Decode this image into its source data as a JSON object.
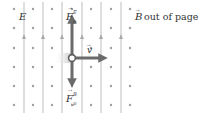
{
  "diagram": {
    "colors": {
      "field_line": "#bdbdbd",
      "dot": "#9e9e9e",
      "vector": "#6b6b6b",
      "text": "#333333",
      "particle_glow": "#e0e0e0"
    },
    "labels": {
      "E_field": "E",
      "B_field_symbol": "B",
      "B_field_text": "out of page",
      "velocity": "v",
      "force_electric_main": "F",
      "force_electric_sub": "p",
      "force_electric_sup": "E",
      "force_magnetic_main": "F",
      "force_magnetic_sub": "p",
      "force_magnetic_sup": "B"
    },
    "grid": {
      "dot_columns_x": [
        14,
        33,
        52,
        72,
        91,
        111,
        130
      ],
      "dot_rows_y": [
        9,
        28,
        48,
        67,
        86,
        105
      ],
      "field_lines_x": [
        24,
        43,
        62,
        82,
        101,
        121
      ],
      "field_direction": "up"
    },
    "particle": {
      "x": 72,
      "y": 58
    },
    "vectors": [
      {
        "name": "F_E",
        "direction": "up",
        "length": 40
      },
      {
        "name": "F_B",
        "direction": "down",
        "length": 26
      },
      {
        "name": "v",
        "direction": "right",
        "length": 32
      }
    ]
  }
}
